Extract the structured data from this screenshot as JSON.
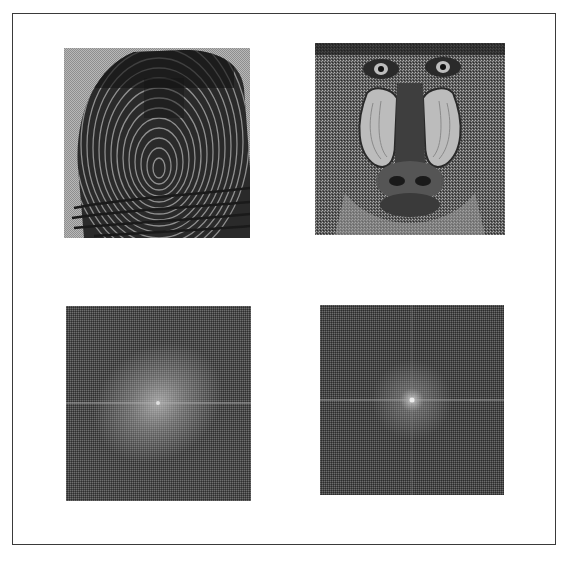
{
  "figure": {
    "panels": [
      {
        "id": "fingerprint",
        "label": "Fingerprint image",
        "position": "top-left",
        "x": 64,
        "y": 48,
        "w": 186,
        "h": 190,
        "background": "#a9a9a9",
        "ink": "#141414"
      },
      {
        "id": "mandrill",
        "label": "Mandrill image",
        "position": "top-right",
        "x": 315,
        "y": 43,
        "w": 190,
        "h": 192,
        "background": "#6a6a6a",
        "ink": "#1a1a1a"
      },
      {
        "id": "fingerprint-spectrum",
        "label": "Fourier spectrum of fingerprint",
        "position": "bottom-left",
        "x": 66,
        "y": 306,
        "w": 185,
        "h": 195,
        "background": "#505050",
        "glow": "#a0a0a0"
      },
      {
        "id": "mandrill-spectrum",
        "label": "Fourier spectrum of mandrill",
        "position": "bottom-right",
        "x": 320,
        "y": 305,
        "w": 184,
        "h": 190,
        "background": "#4d4d4d",
        "glow": "#b4b4b4"
      }
    ],
    "border_color": "#3a3a3a"
  }
}
